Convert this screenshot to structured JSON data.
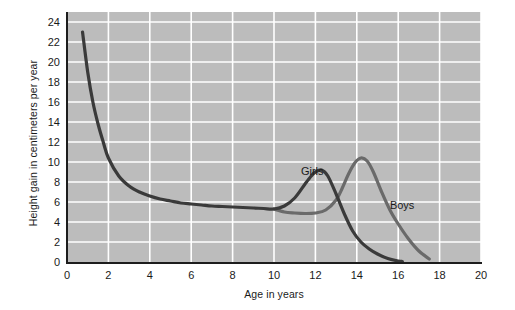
{
  "chart_data": {
    "type": "line",
    "title": "",
    "xlabel": "Age in years",
    "ylabel": "Height gain in centimeters per year",
    "xlim": [
      0,
      20
    ],
    "ylim": [
      0,
      25
    ],
    "xticks": [
      0,
      2,
      4,
      6,
      8,
      10,
      12,
      14,
      16,
      18,
      20
    ],
    "yticks": [
      0,
      2,
      4,
      6,
      8,
      10,
      12,
      14,
      16,
      18,
      20,
      22,
      24
    ],
    "grid": true,
    "legend": "inline-annotations",
    "plot_background": "#bcbcbc",
    "gridline_color": "#ffffff",
    "axis_color": "#1d1d1d",
    "series": [
      {
        "name": "Girls",
        "color": "#3a3a3a",
        "label_x": 11.3,
        "label_y": 9.0,
        "x": [
          0.75,
          1.0,
          1.25,
          1.5,
          1.75,
          2.0,
          2.5,
          3.0,
          3.5,
          4.0,
          4.5,
          5.0,
          5.5,
          6.0,
          6.5,
          7.0,
          7.5,
          8.0,
          8.5,
          9.0,
          9.5,
          10.0,
          10.5,
          11.0,
          11.5,
          11.8,
          12.0,
          12.3,
          12.6,
          13.0,
          13.4,
          13.8,
          14.2,
          14.6,
          15.0,
          15.5,
          16.0,
          16.2
        ],
        "y": [
          23.0,
          19.0,
          16.0,
          13.8,
          12.0,
          10.4,
          8.6,
          7.6,
          7.0,
          6.6,
          6.3,
          6.1,
          5.9,
          5.8,
          5.7,
          5.6,
          5.55,
          5.5,
          5.45,
          5.4,
          5.35,
          5.3,
          5.6,
          6.4,
          7.8,
          8.6,
          9.0,
          9.2,
          8.6,
          6.8,
          4.8,
          3.1,
          2.0,
          1.3,
          0.8,
          0.35,
          0.1,
          0.05
        ]
      },
      {
        "name": "Boys",
        "color": "#6a6a6a",
        "label_x": 15.6,
        "label_y": 5.6,
        "x": [
          10.0,
          10.5,
          11.0,
          11.5,
          12.0,
          12.5,
          13.0,
          13.3,
          13.6,
          13.9,
          14.2,
          14.5,
          14.8,
          15.2,
          15.6,
          16.0,
          16.5,
          17.0,
          17.5
        ],
        "y": [
          5.3,
          5.0,
          4.9,
          4.85,
          4.9,
          5.2,
          6.2,
          7.4,
          8.8,
          9.9,
          10.4,
          10.1,
          9.0,
          7.0,
          5.2,
          3.8,
          2.3,
          1.1,
          0.3
        ]
      }
    ],
    "notes": {
      "common_curve_end_age": 10,
      "girls_peak": {
        "age": 12.3,
        "value": 9.2
      },
      "boys_peak": {
        "age": 14.2,
        "value": 10.4
      },
      "infancy_start": {
        "age": 0.75,
        "value": 23.0
      }
    }
  }
}
